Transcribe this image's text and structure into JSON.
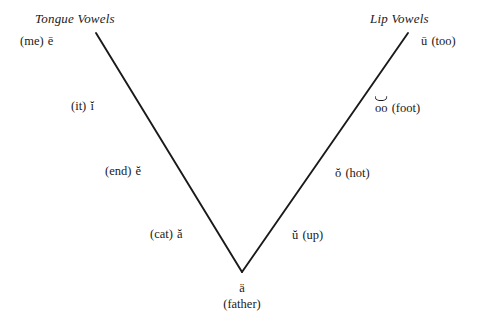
{
  "diagram": {
    "title_left": "Tongue Vowels",
    "title_right": "Lip Vowels",
    "line_color": "#1a1a1a",
    "background_color": "#ffffff"
  },
  "left_arm": {
    "items": [
      {
        "gloss": "(me)",
        "symbol": "ē"
      },
      {
        "gloss": "(it)",
        "symbol": "ĭ"
      },
      {
        "gloss": "(end)",
        "symbol": "ĕ"
      },
      {
        "gloss": "(cat)",
        "symbol": "ă"
      }
    ]
  },
  "right_arm": {
    "items": [
      {
        "symbol": "ū",
        "gloss": "(too)"
      },
      {
        "symbol": "oo",
        "gloss": "(foot)"
      },
      {
        "symbol": "ŏ",
        "gloss": "(hot)"
      },
      {
        "symbol": "ŭ",
        "gloss": "(up)"
      }
    ]
  },
  "vertex": {
    "symbol": "ä",
    "gloss": "(father)"
  }
}
